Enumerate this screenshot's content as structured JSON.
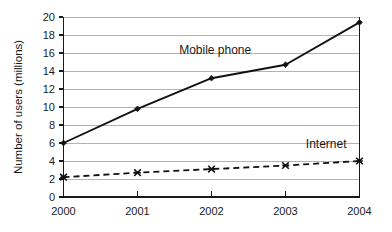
{
  "chart_data": {
    "type": "line",
    "title": "",
    "xlabel": "",
    "ylabel": "Number of users (millions)",
    "x": [
      "2000",
      "2001",
      "2002",
      "2003",
      "2004"
    ],
    "categories": [
      "2000",
      "2001",
      "2002",
      "2003",
      "2004"
    ],
    "xlim": [
      2000,
      2004
    ],
    "ylim": [
      0,
      20
    ],
    "yticks": [
      0,
      2,
      4,
      6,
      8,
      10,
      12,
      14,
      16,
      18,
      20
    ],
    "ytick_labels": [
      "0",
      "2",
      "4",
      "6",
      "8",
      "10",
      "12",
      "14",
      "16",
      "18",
      "20"
    ],
    "xtick_labels": [
      "2000",
      "2001",
      "2002",
      "2003",
      "2004"
    ],
    "grid": "horizontal",
    "legend_position": "inline-annotation",
    "series": [
      {
        "name": "Mobile phone",
        "values": [
          6.0,
          9.8,
          13.2,
          14.7,
          19.4
        ],
        "line_style": "solid",
        "marker": "diamond",
        "color": "#111111",
        "annotation": "Mobile phone"
      },
      {
        "name": "Internet",
        "values": [
          2.2,
          2.7,
          3.1,
          3.5,
          4.0
        ],
        "line_style": "dashed",
        "marker": "cross",
        "color": "#111111",
        "annotation": "Internet"
      }
    ],
    "annotations": [
      {
        "text": "Mobile phone",
        "x_value": 2002.05,
        "y_value": 15.9
      },
      {
        "text": "Internet",
        "x_value": 2003.55,
        "y_value": 5.4
      }
    ]
  },
  "axis": {
    "y_title": "Number of users (millions)",
    "y_labels": {
      "t0": "0",
      "t2": "2",
      "t4": "4",
      "t6": "6",
      "t8": "8",
      "t10": "10",
      "t12": "12",
      "t14": "14",
      "t16": "16",
      "t18": "18",
      "t20": "20"
    },
    "x_labels": {
      "c0": "2000",
      "c1": "2001",
      "c2": "2002",
      "c3": "2003",
      "c4": "2004"
    }
  },
  "annotations": {
    "mobile_phone": "Mobile phone",
    "internet": "Internet"
  },
  "colors": {
    "background": "#ffffff",
    "gridline": "#b3b3b3",
    "axis": "#1a1a1a",
    "series": "#111111"
  }
}
